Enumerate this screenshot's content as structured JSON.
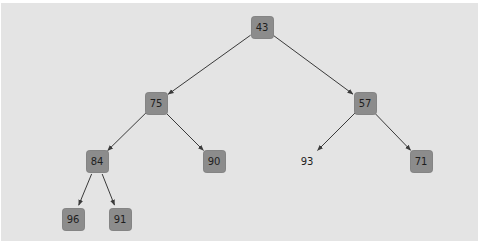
{
  "diagram": {
    "type": "binary-tree",
    "colors": {
      "background": "#e4e4e4",
      "node_fill": "#8c8c8c",
      "edge": "#3a3a3a",
      "text": "#1e1e1e"
    },
    "nodes": [
      {
        "id": "n43",
        "label": "43",
        "boxed": true
      },
      {
        "id": "n75",
        "label": "75",
        "boxed": true
      },
      {
        "id": "n57",
        "label": "57",
        "boxed": true
      },
      {
        "id": "n84",
        "label": "84",
        "boxed": true
      },
      {
        "id": "n90",
        "label": "90",
        "boxed": true
      },
      {
        "id": "n93",
        "label": "93",
        "boxed": false
      },
      {
        "id": "n71",
        "label": "71",
        "boxed": true
      },
      {
        "id": "n96",
        "label": "96",
        "boxed": true
      },
      {
        "id": "n91",
        "label": "91",
        "boxed": true
      }
    ],
    "edges": [
      {
        "from": "n43",
        "to": "n75"
      },
      {
        "from": "n43",
        "to": "n57"
      },
      {
        "from": "n75",
        "to": "n84"
      },
      {
        "from": "n75",
        "to": "n90"
      },
      {
        "from": "n57",
        "to": "n93"
      },
      {
        "from": "n57",
        "to": "n71"
      },
      {
        "from": "n84",
        "to": "n96"
      },
      {
        "from": "n84",
        "to": "n91"
      }
    ]
  }
}
